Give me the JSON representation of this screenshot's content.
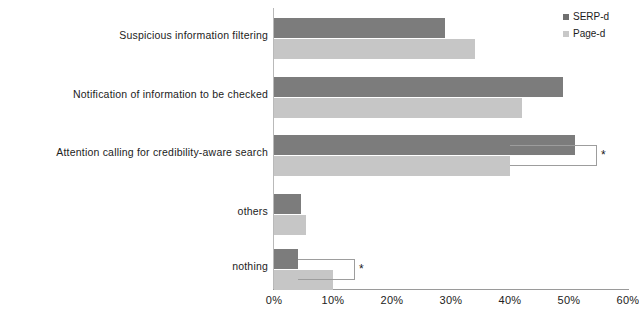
{
  "chart_data": {
    "type": "bar",
    "orientation": "horizontal",
    "title": "",
    "xlabel": "",
    "ylabel": "",
    "xlim": [
      0,
      60
    ],
    "xunit": "%",
    "grid": false,
    "legend_position": "top-right",
    "categories": [
      "Suspicious information filtering",
      "Notification of information to be checked",
      "Attention calling for credibility-aware search",
      "others",
      "nothing"
    ],
    "series": [
      {
        "name": "SERP-d",
        "color": "#7c7c7c",
        "values": [
          29,
          49,
          51,
          4.5,
          4
        ]
      },
      {
        "name": "Page-d",
        "color": "#c6c6c6",
        "values": [
          34,
          42,
          40,
          5.5,
          10
        ]
      }
    ],
    "ticks": [
      "0%",
      "10%",
      "20%",
      "30%",
      "40%",
      "50%",
      "60%"
    ],
    "tick_values": [
      0,
      10,
      20,
      30,
      40,
      50,
      60
    ],
    "annotations": [
      {
        "label": "*",
        "category": "Attention calling for credibility-aware search",
        "from": 51,
        "to": 40
      },
      {
        "label": "*",
        "category": "nothing",
        "from": 4,
        "to": 10
      }
    ]
  }
}
